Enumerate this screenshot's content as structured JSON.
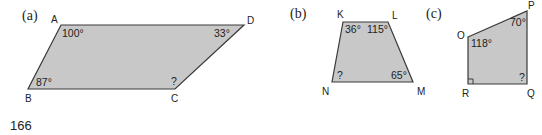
{
  "figures": [
    {
      "id": "a",
      "label": "(a)",
      "vertices": [
        {
          "name": "A",
          "angle": "100°"
        },
        {
          "name": "B",
          "angle": "87°"
        },
        {
          "name": "C",
          "angle": "?"
        },
        {
          "name": "D",
          "angle": "33°"
        }
      ]
    },
    {
      "id": "b",
      "label": "(b)",
      "vertices": [
        {
          "name": "K",
          "angle": "36°"
        },
        {
          "name": "L",
          "angle": "115°"
        },
        {
          "name": "M",
          "angle": "65°"
        },
        {
          "name": "N",
          "angle": "?"
        }
      ]
    },
    {
      "id": "c",
      "label": "(c)",
      "vertices": [
        {
          "name": "O",
          "angle": "118°"
        },
        {
          "name": "P",
          "angle": "70°"
        },
        {
          "name": "Q",
          "angle": "?"
        },
        {
          "name": "R",
          "angle": "right angle"
        }
      ]
    }
  ],
  "page_number": "166",
  "colors": {
    "fill": "#c8c8c8",
    "stroke": "#3a3a3a",
    "text": "#222222"
  }
}
